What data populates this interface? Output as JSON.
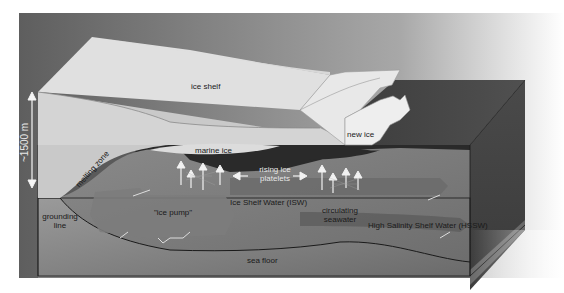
{
  "diagram": {
    "type": "cross-section",
    "depth_scale": {
      "label": "~1500 m",
      "icon": "double-arrow-vertical-icon"
    },
    "labels": {
      "ice_shelf": "ice shelf",
      "new_ice": "new ice",
      "marine_ice": "marine ice",
      "rising_ice_platelets_line1": "rising ice",
      "rising_ice_platelets_line2": "platelets",
      "melting_zone": "melting zone",
      "grounding_line_line1": "grounding",
      "grounding_line_line2": "line",
      "ice_pump": "\"ice pump\"",
      "isw": "Ice Shelf Water (ISW)",
      "circulating_seawater_line1": "circulating",
      "circulating_seawater_line2": "seawater",
      "hssw": "High Salinity Shelf Water (HSSW)",
      "sea_floor": "sea floor"
    },
    "colors": {
      "background_sky": "#6a6a6a",
      "ice_shelf_top": "#e2e2e2",
      "ice_shelf_face": "#d0d0d0",
      "ocean_dark": "#2e2e2e",
      "water_mid": "#7a7a7a",
      "sea_floor": "#8e8e8e",
      "arrow": "#f0f0f0"
    }
  }
}
